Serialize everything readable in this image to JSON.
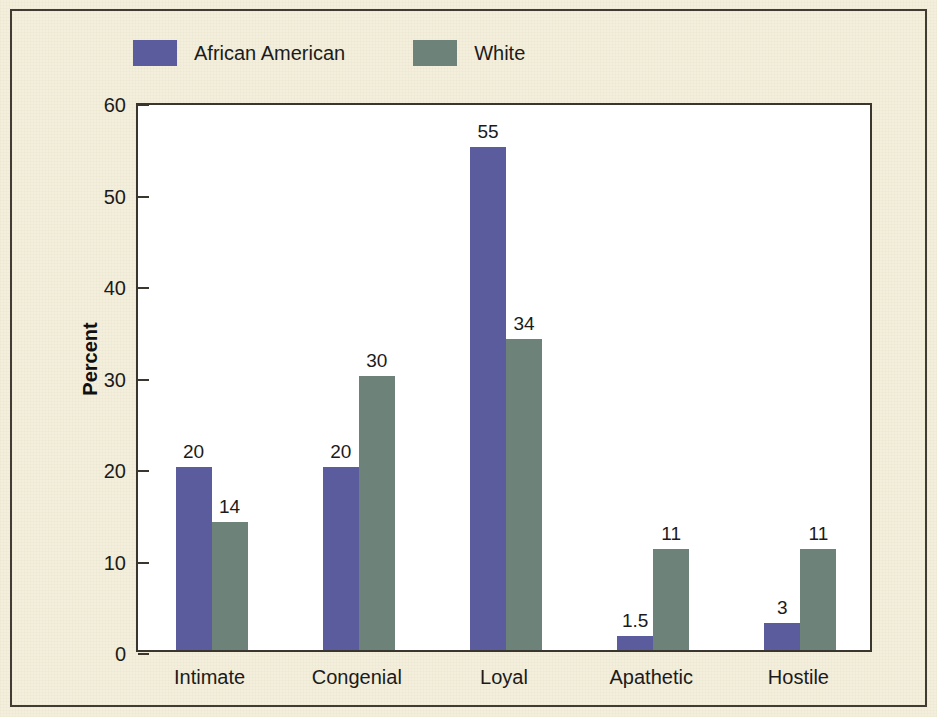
{
  "figure": {
    "background_color": "#f3efdc",
    "plot_background_color": "#ffffff",
    "frame_color": "#3a362e"
  },
  "legend": {
    "position": "top-left",
    "entries": [
      {
        "label": "African American",
        "color": "#5a5c9e",
        "swatch_icon": "legend-swatch-square"
      },
      {
        "label": "White",
        "color": "#6d8279",
        "swatch_icon": "legend-swatch-square"
      }
    ]
  },
  "axes": {
    "y_title": "Percent",
    "y_ticks": [
      "0",
      "10",
      "20",
      "30",
      "40",
      "50",
      "60"
    ],
    "y_min": 0,
    "y_max": 60,
    "x_ticks": [
      "Intimate",
      "Congenial",
      "Loyal",
      "Apathetic",
      "Hostile"
    ]
  },
  "chart_data": {
    "type": "bar",
    "title": "",
    "xlabel": "",
    "ylabel": "Percent",
    "ylim": [
      0,
      60
    ],
    "grid": false,
    "legend_position": "top-left",
    "categories": [
      "Intimate",
      "Congenial",
      "Loyal",
      "Apathetic",
      "Hostile"
    ],
    "series": [
      {
        "name": "African American",
        "color": "#5a5c9e",
        "values": [
          20,
          20,
          55,
          1.5,
          3
        ],
        "labels": [
          "20",
          "20",
          "55",
          "1.5",
          "3"
        ]
      },
      {
        "name": "White",
        "color": "#6d8279",
        "values": [
          14,
          30,
          34,
          11,
          11
        ],
        "labels": [
          "14",
          "30",
          "34",
          "11",
          "11"
        ]
      }
    ]
  }
}
